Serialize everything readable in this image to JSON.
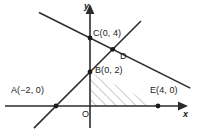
{
  "figure": {
    "kind": "coordinate-geometry-diagram",
    "stroke_color": "#2b2b2b",
    "hatch_color": "#8a8a8a",
    "background_color": "#ffffff",
    "axes": {
      "x_label": "x",
      "y_label": "y",
      "origin_label": "O",
      "origin_px": {
        "x": 90,
        "y": 106
      },
      "unit_px": 17,
      "x_range": [
        -5.0,
        6.3
      ],
      "y_range": [
        -1.8,
        6.2
      ]
    },
    "points": [
      {
        "name": "A",
        "label": "A(−2, 0)",
        "x": -2,
        "y": 0,
        "dot": true
      },
      {
        "name": "B",
        "label": "B(0, 2)",
        "x": 0,
        "y": 2,
        "dot": true
      },
      {
        "name": "C",
        "label": "C(0, 4)",
        "x": 0,
        "y": 4,
        "dot": true
      },
      {
        "name": "D",
        "label": "D",
        "x": 1.333,
        "y": 3.333,
        "dot": true
      },
      {
        "name": "E",
        "label": "E(4, 0)",
        "x": 4,
        "y": 0,
        "dot": true
      }
    ],
    "lines": [
      {
        "name": "line-A-B-D",
        "through": [
          "A(-2, 0)",
          "B(0, 2)",
          "D"
        ],
        "equation": "y = x + 2",
        "slope": 1,
        "intercept": 2,
        "from": {
          "x": -3.3,
          "y": -1.3
        },
        "to": {
          "x": 3.0,
          "y": 5.0
        }
      },
      {
        "name": "line-C-D-E",
        "through": [
          "C(0, 4)",
          "D",
          "E(4, 0)"
        ],
        "equation": "y = 4 - x/2",
        "slope": -0.5,
        "intercept": 4,
        "from": {
          "x": -3.0,
          "y": 5.5
        },
        "to": {
          "x": 5.9,
          "y": 1.05
        }
      }
    ],
    "shaded_region": {
      "name": "triangle-B-O-E",
      "vertices": [
        "B(0, 2)",
        "O(0, 0)",
        "E(4, 0)"
      ],
      "fill": "hatch",
      "hatch_angle_deg": 45
    }
  },
  "labels": {
    "point_c": "C(0, 4)",
    "point_d": "D",
    "point_b": "B(0, 2)",
    "point_a": "A(−2, 0)",
    "point_e": "E(4, 0)",
    "axis_x": "x",
    "axis_y": "y",
    "origin": "O"
  }
}
